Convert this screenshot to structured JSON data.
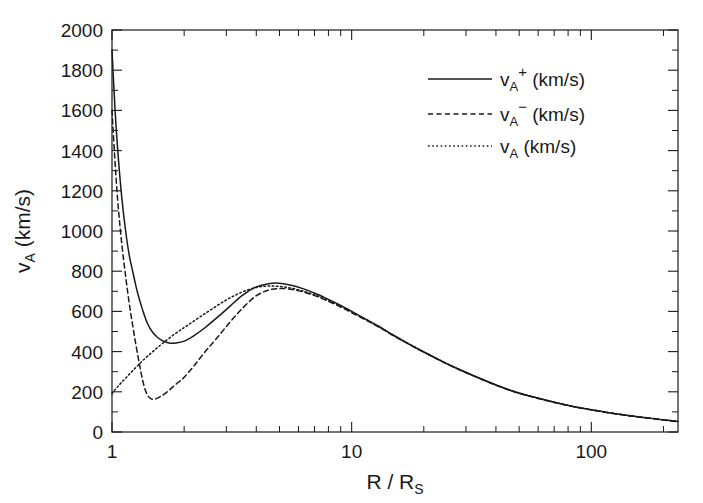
{
  "figure": {
    "background_color": "#ffffff",
    "ink_color": "#1a1a1a"
  },
  "chart_data": {
    "type": "line",
    "title": "",
    "xlabel": "R / R_S",
    "xlabel_main": "R / R",
    "xlabel_sub": "S",
    "ylabel": "v_A (km/s)",
    "ylabel_main_pre": "v",
    "ylabel_sub": "A",
    "ylabel_main_post": " (km/s)",
    "xscale": "log",
    "yscale": "linear",
    "xlim": [
      1,
      230
    ],
    "ylim": [
      0,
      2000
    ],
    "grid": false,
    "legend_position": "upper right",
    "xticks_major": [
      1,
      10,
      100
    ],
    "xtick_labels": [
      "1",
      "10",
      "100"
    ],
    "xticks_minor": [
      2,
      3,
      4,
      5,
      6,
      7,
      8,
      9,
      20,
      30,
      40,
      50,
      60,
      70,
      80,
      90,
      200
    ],
    "yticks_major": [
      0,
      200,
      400,
      600,
      800,
      1000,
      1200,
      1400,
      1600,
      1800,
      2000
    ],
    "ytick_labels": [
      "0",
      "200",
      "400",
      "600",
      "800",
      "1000",
      "1200",
      "1400",
      "1600",
      "1800",
      "2000"
    ],
    "yticks_minor": [
      100,
      300,
      500,
      700,
      900,
      1100,
      1300,
      1500,
      1700,
      1900
    ],
    "series": [
      {
        "name": "v_A+ (km/s)",
        "label_main": "v",
        "label_sub": "A",
        "label_sup": "+",
        "label_unit": "(km/s)",
        "style": "solid",
        "color": "#1a1a1a",
        "x": [
          1.0,
          1.03,
          1.06,
          1.1,
          1.14,
          1.18,
          1.23,
          1.28,
          1.34,
          1.4,
          1.47,
          1.55,
          1.65,
          1.75,
          1.85,
          2.0,
          2.2,
          2.45,
          2.75,
          3.1,
          3.5,
          4.0,
          4.5,
          5.0,
          5.6,
          6.3,
          7.1,
          8.0,
          9.0,
          10.0,
          11.5,
          13.0,
          15.0,
          17.5,
          20.0,
          24.0,
          28.0,
          33.0,
          40.0,
          48.0,
          57.0,
          70.0,
          85.0,
          100.0,
          120.0,
          145.0,
          175.0,
          205.0,
          230.0
        ],
        "y": [
          1900,
          1600,
          1380,
          1160,
          1000,
          880,
          780,
          690,
          610,
          545,
          500,
          470,
          450,
          442,
          443,
          452,
          480,
          520,
          570,
          625,
          680,
          722,
          738,
          740,
          730,
          712,
          688,
          660,
          630,
          600,
          560,
          525,
          480,
          435,
          398,
          350,
          312,
          275,
          234,
          200,
          175,
          148,
          126,
          111,
          95,
          81,
          69,
          59,
          52
        ]
      },
      {
        "name": "v_A- (km/s)",
        "label_main": "v",
        "label_sub": "A",
        "label_sup": "−",
        "label_unit": "(km/s)",
        "style": "dashed",
        "color": "#1a1a1a",
        "x": [
          1.0,
          1.03,
          1.06,
          1.1,
          1.14,
          1.18,
          1.22,
          1.26,
          1.3,
          1.34,
          1.38,
          1.43,
          1.5,
          1.6,
          1.72,
          1.85,
          2.0,
          2.2,
          2.45,
          2.75,
          3.1,
          3.5,
          4.0,
          4.5,
          5.0,
          5.6,
          6.3,
          7.1,
          8.0,
          9.0,
          10.0,
          11.5,
          13.0,
          15.0,
          17.5,
          20.0,
          24.0,
          28.0,
          33.0,
          40.0,
          48.0,
          57.0,
          70.0,
          85.0,
          100.0,
          120.0,
          145.0,
          175.0,
          205.0,
          230.0
        ],
        "y": [
          1600,
          1340,
          1130,
          930,
          775,
          640,
          530,
          430,
          340,
          262,
          205,
          172,
          163,
          178,
          205,
          238,
          272,
          330,
          400,
          470,
          545,
          615,
          678,
          706,
          714,
          710,
          696,
          676,
          650,
          622,
          594,
          556,
          522,
          478,
          434,
          397,
          349,
          311,
          274,
          233,
          199,
          174,
          147,
          125,
          110,
          94,
          80,
          68,
          58,
          51
        ]
      },
      {
        "name": "v_A (km/s)",
        "label_main": "v",
        "label_sub": "A",
        "label_sup": "",
        "label_unit": "(km/s)",
        "style": "dotted",
        "color": "#1a1a1a",
        "x": [
          1.0,
          1.02,
          1.05,
          1.09,
          1.14,
          1.2,
          1.28,
          1.38,
          1.5,
          1.65,
          1.85,
          2.05,
          2.3,
          2.6,
          2.95,
          3.3,
          3.7,
          4.1,
          4.5,
          5.0,
          5.6,
          6.3,
          7.1,
          8.0,
          9.0,
          10.0,
          11.5,
          13.0,
          15.0,
          17.5,
          20.0,
          24.0,
          28.0,
          33.0,
          40.0,
          48.0,
          57.0,
          70.0,
          85.0,
          100.0,
          120.0,
          145.0,
          175.0,
          205.0,
          230.0
        ],
        "y": [
          190,
          205,
          222,
          244,
          268,
          296,
          330,
          368,
          406,
          447,
          492,
          528,
          568,
          610,
          652,
          683,
          708,
          722,
          726,
          724,
          716,
          700,
          680,
          654,
          626,
          598,
          559,
          524,
          480,
          436,
          399,
          350,
          312,
          275,
          234,
          200,
          175,
          148,
          126,
          111,
          95,
          81,
          69,
          59,
          52
        ]
      }
    ]
  }
}
